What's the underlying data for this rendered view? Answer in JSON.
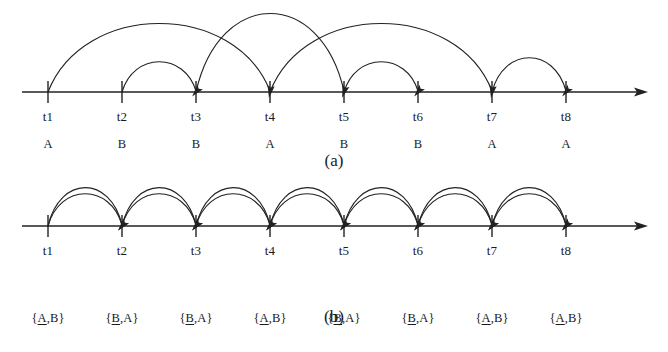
{
  "figure": {
    "panels": [
      {
        "id": "a",
        "caption": "(a)",
        "axis": {
          "x_start": 22,
          "x_end": 648,
          "baseline_y": 92,
          "tick_half_above": 11,
          "tick_half_below": 11
        },
        "timepoints": [
          {
            "label": "t1",
            "x": 48,
            "symbol": "A"
          },
          {
            "label": "t2",
            "x": 122,
            "symbol": "B"
          },
          {
            "label": "t3",
            "x": 196,
            "symbol": "B"
          },
          {
            "label": "t4",
            "x": 270,
            "symbol": "A"
          },
          {
            "label": "t5",
            "x": 344,
            "symbol": "B"
          },
          {
            "label": "t6",
            "x": 418,
            "symbol": "B"
          },
          {
            "label": "t7",
            "x": 492,
            "symbol": "A"
          },
          {
            "label": "t8",
            "x": 566,
            "symbol": "A"
          }
        ],
        "arcs": [
          {
            "from": "t1",
            "to": "t4",
            "height": 68,
            "arrow": "end"
          },
          {
            "from": "t2",
            "to": "t3",
            "height": 30,
            "arrow": "end"
          },
          {
            "from": "t3",
            "to": "t5",
            "height": 78,
            "arrow": "end"
          },
          {
            "from": "t4",
            "to": "t7",
            "height": 68,
            "arrow": "end"
          },
          {
            "from": "t5",
            "to": "t6",
            "height": 30,
            "arrow": "end"
          },
          {
            "from": "t7",
            "to": "t8",
            "height": 34,
            "arrow": "end"
          }
        ]
      },
      {
        "id": "b",
        "caption": "(b)",
        "axis": {
          "x_start": 22,
          "x_end": 648,
          "baseline_y": 46,
          "tick_half_above": 11,
          "tick_half_below": 11
        },
        "timepoints": [
          {
            "label": "t1",
            "x": 48,
            "set": [
              "A",
              "B"
            ],
            "underline_index": 0
          },
          {
            "label": "t2",
            "x": 122,
            "set": [
              "B",
              "A"
            ],
            "underline_index": 0
          },
          {
            "label": "t3",
            "x": 196,
            "set": [
              "B",
              "A"
            ],
            "underline_index": 0
          },
          {
            "label": "t4",
            "x": 270,
            "set": [
              "A",
              "B"
            ],
            "underline_index": 0
          },
          {
            "label": "t5",
            "x": 344,
            "set": [
              "B",
              "A"
            ],
            "underline_index": 0
          },
          {
            "label": "t6",
            "x": 418,
            "set": [
              "B",
              "A"
            ],
            "underline_index": 0
          },
          {
            "label": "t7",
            "x": 492,
            "set": [
              "A",
              "B"
            ],
            "underline_index": 0
          },
          {
            "label": "t8",
            "x": 566,
            "set": [
              "A",
              "B"
            ],
            "underline_index": 0
          }
        ],
        "arcs": [
          {
            "from": "t1",
            "to": "t2",
            "height": 32,
            "arrow": "end"
          },
          {
            "from": "t1",
            "to": "t2",
            "height": 38,
            "arrow": "end"
          },
          {
            "from": "t2",
            "to": "t3",
            "height": 32,
            "arrow": "end"
          },
          {
            "from": "t2",
            "to": "t3",
            "height": 38,
            "arrow": "end"
          },
          {
            "from": "t3",
            "to": "t4",
            "height": 32,
            "arrow": "end"
          },
          {
            "from": "t3",
            "to": "t4",
            "height": 38,
            "arrow": "end"
          },
          {
            "from": "t4",
            "to": "t5",
            "height": 32,
            "arrow": "end"
          },
          {
            "from": "t4",
            "to": "t5",
            "height": 38,
            "arrow": "end"
          },
          {
            "from": "t5",
            "to": "t6",
            "height": 32,
            "arrow": "end"
          },
          {
            "from": "t5",
            "to": "t6",
            "height": 38,
            "arrow": "end"
          },
          {
            "from": "t6",
            "to": "t7",
            "height": 32,
            "arrow": "end"
          },
          {
            "from": "t6",
            "to": "t7",
            "height": 38,
            "arrow": "end"
          },
          {
            "from": "t7",
            "to": "t8",
            "height": 32,
            "arrow": "end"
          },
          {
            "from": "t7",
            "to": "t8",
            "height": 38,
            "arrow": "end"
          }
        ]
      }
    ],
    "colors": {
      "ink": "#222222",
      "background": "#ffffff"
    },
    "layout": {
      "panel_a_top": 0,
      "panel_b_top": 180,
      "tick_label_dy": 18,
      "symbol_label_dy": 46,
      "set_label_dy": 86,
      "caption_a_y": 152,
      "caption_b_y": 128
    }
  }
}
